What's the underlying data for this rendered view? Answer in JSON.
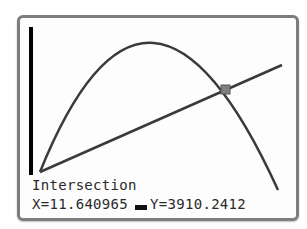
{
  "calculator": {
    "mode": "graph",
    "status_label": "Intersection",
    "x_label": "X=",
    "x_value": "11.640965",
    "y_label": "Y=",
    "y_value": "3910.2412"
  },
  "graph": {
    "curves": [
      {
        "name": "parabola",
        "description": "downward-opening parabola starting at origin"
      },
      {
        "name": "line",
        "description": "straight increasing line from origin"
      }
    ],
    "intersection_marker": {
      "x": "11.640965",
      "y": "3910.2412"
    },
    "colors": {
      "curve": "#3a3a3a",
      "axis": "#000000",
      "frame": "#7d7d7d",
      "marker": "#7a7a7a"
    }
  }
}
